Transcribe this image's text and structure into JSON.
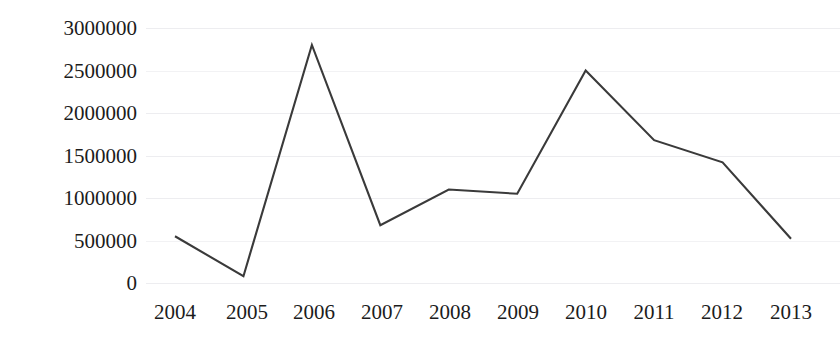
{
  "chart_data": {
    "type": "line",
    "title": "",
    "subtitle": "",
    "xlabel": "",
    "ylabel": "",
    "categories": [
      "2004",
      "2005",
      "2006",
      "2007",
      "2008",
      "2009",
      "2010",
      "2011",
      "2012",
      "2013"
    ],
    "values": [
      550000,
      80000,
      2800000,
      680000,
      1100000,
      1050000,
      2500000,
      1680000,
      1420000,
      520000
    ],
    "series": [
      {
        "name": "",
        "values": [
          550000,
          80000,
          2800000,
          680000,
          1100000,
          1050000,
          2500000,
          1680000,
          1420000,
          520000
        ]
      }
    ],
    "ylim": [
      0,
      3000000
    ],
    "yticks": [
      0,
      500000,
      1000000,
      1500000,
      2000000,
      2500000,
      3000000
    ],
    "ytick_labels": [
      "0",
      "500000",
      "1000000",
      "1500000",
      "2000000",
      "2500000",
      "3000000"
    ],
    "xtick_labels": [
      "2004",
      "2005",
      "2006",
      "2007",
      "2008",
      "2009",
      "2010",
      "2011",
      "2012",
      "2013"
    ],
    "grid": true,
    "grid_axis": "y",
    "legend": false,
    "legend_position": "none",
    "markers": false,
    "line_color": "#3a3a3a",
    "grid_color": "#ededf0",
    "text_color": "#1c1c1c",
    "background_color": "#ffffff",
    "annotations": []
  }
}
